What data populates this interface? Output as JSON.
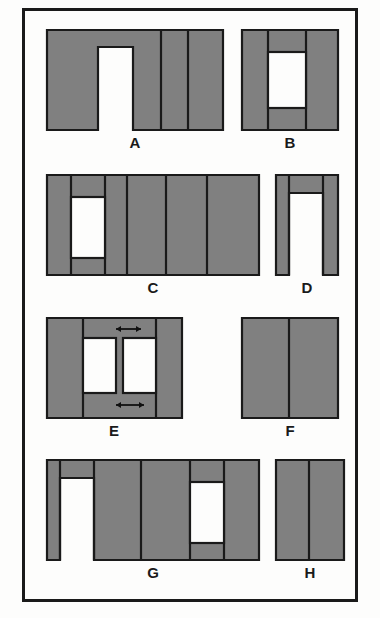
{
  "figure": {
    "background_color": "#fdfdfc",
    "frame_color": "#1a1a1a",
    "fill_color": "#808080",
    "stroke_color": "#1a1a1a",
    "label_color": "#1a1a1a",
    "shapes": [
      {
        "label": "A",
        "type": "rectangle-with-bottom-notch",
        "x": 47,
        "y": 30,
        "width": 176,
        "height": 100,
        "notch": {
          "x": 51,
          "y": 17,
          "width": 35,
          "height": 83
        },
        "dividers": [
          114,
          141
        ],
        "top_band_y": 17,
        "label_x": 135,
        "label_y": 135
      },
      {
        "label": "B",
        "type": "rectangle-with-hole",
        "x": 242,
        "y": 30,
        "width": 96,
        "height": 100,
        "hole": {
          "x": 26,
          "y": 22,
          "width": 38,
          "height": 56
        },
        "dividers": [
          26,
          64
        ],
        "label_x": 290,
        "label_y": 135
      },
      {
        "label": "C",
        "type": "rectangle-with-hole",
        "x": 47,
        "y": 175,
        "width": 212,
        "height": 100,
        "hole": {
          "x": 24,
          "y": 22,
          "width": 34,
          "height": 61
        },
        "dividers": [
          24,
          58,
          80,
          119,
          160
        ],
        "label_x": 153,
        "label_y": 280
      },
      {
        "label": "D",
        "type": "arch",
        "x": 276,
        "y": 175,
        "width": 62,
        "height": 100,
        "opening": {
          "x": 13,
          "y": 18,
          "width": 34,
          "height": 82
        },
        "dividers": [
          13,
          47
        ],
        "label_x": 307,
        "label_y": 280
      },
      {
        "label": "E",
        "type": "rectangle-with-two-holes",
        "x": 47,
        "y": 318,
        "width": 135,
        "height": 100,
        "holes": [
          {
            "x": 36,
            "y": 20,
            "width": 33,
            "height": 55
          },
          {
            "x": 76,
            "y": 20,
            "width": 33,
            "height": 55
          }
        ],
        "dividers": [
          36,
          109
        ],
        "arrows": [
          {
            "name": "top-dimension-arrow",
            "x1": 69,
            "x2": 94,
            "y": 11
          },
          {
            "name": "bottom-dimension-arrow",
            "x1": 69,
            "x2": 97,
            "y": 87
          }
        ],
        "label_x": 114,
        "label_y": 423
      },
      {
        "label": "F",
        "type": "solid-rectangle",
        "x": 242,
        "y": 318,
        "width": 96,
        "height": 100,
        "dividers": [
          47
        ],
        "label_x": 290,
        "label_y": 423
      },
      {
        "label": "G",
        "type": "rectangle-with-notch-and-hole",
        "x": 47,
        "y": 460,
        "width": 212,
        "height": 100,
        "notch": {
          "x": 13,
          "y": 18,
          "width": 34,
          "height": 82
        },
        "hole": {
          "x": 143,
          "y": 22,
          "width": 34,
          "height": 61
        },
        "dividers": [
          13,
          47,
          94,
          143,
          177
        ],
        "label_x": 153,
        "label_y": 565
      },
      {
        "label": "H",
        "type": "solid-rectangle",
        "x": 276,
        "y": 460,
        "width": 68,
        "height": 100,
        "dividers": [
          33
        ],
        "label_x": 310,
        "label_y": 565
      }
    ]
  }
}
